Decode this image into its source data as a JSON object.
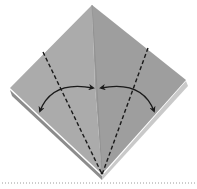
{
  "diagram": {
    "type": "origami-step",
    "paper_colors": {
      "left_face": "#ababab",
      "right_face": "#9e9e9e",
      "lower_left_edge": "#8c8c8c",
      "lower_right_edge": "#c9c9c9"
    },
    "line_color": "#1a1a1a",
    "fold_lines": [
      {
        "name": "left-valley-fold",
        "style": "dashed"
      },
      {
        "name": "right-valley-fold",
        "style": "dashed"
      }
    ],
    "arrows": [
      {
        "name": "left-fold-and-unfold-arrow",
        "direction": "both"
      },
      {
        "name": "right-fold-and-unfold-arrow",
        "direction": "both"
      }
    ],
    "separator": {
      "style": "dotted",
      "color": "#9a9a9a"
    }
  }
}
